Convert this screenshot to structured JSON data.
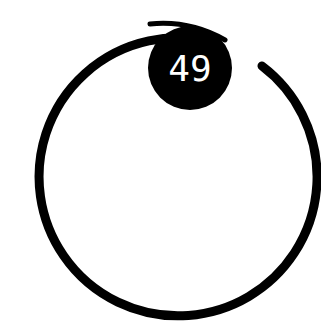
{
  "badge": {
    "value": "49"
  },
  "ring": {
    "color": "#000000",
    "background": "#ffffff"
  }
}
